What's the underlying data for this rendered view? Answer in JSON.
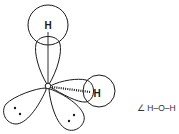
{
  "diagram": {
    "atoms": {
      "center": "O",
      "hydrogen_top": "H",
      "hydrogen_right": "H"
    },
    "lone_pairs": [
      {
        "name": "lone-pair-left",
        "electrons": 2
      },
      {
        "name": "lone-pair-bottom",
        "electrons": 2
      }
    ],
    "caption": "∠ H–O–H"
  }
}
